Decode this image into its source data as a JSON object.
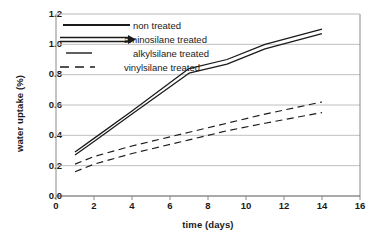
{
  "chart_data": {
    "type": "line",
    "title": "",
    "xlabel": "time (days)",
    "ylabel": "water uptake (%)",
    "xlim": [
      0,
      16
    ],
    "ylim": [
      0.0,
      1.2
    ],
    "xticks": [
      "0",
      "2",
      "4",
      "6",
      "8",
      "10",
      "12",
      "14",
      "16"
    ],
    "yticks": [
      "0.0",
      "0.2",
      "0.4",
      "0.6",
      "0.8",
      "1.0",
      "1.2"
    ],
    "grid": "horizontal",
    "legend_position": "top-left",
    "x": [
      1,
      2,
      4,
      7,
      9,
      11,
      14
    ],
    "series": [
      {
        "name": "non treated",
        "style": "solid",
        "values": [
          0.29,
          0.38,
          0.56,
          0.84,
          0.9,
          1.0,
          1.1
        ]
      },
      {
        "name": "aminosilane treated",
        "style": "solid",
        "values": [
          0.27,
          0.36,
          0.54,
          0.81,
          0.87,
          0.97,
          1.07
        ]
      },
      {
        "name": "alkylsilane treated",
        "style": "dashed",
        "values": [
          0.21,
          0.26,
          0.33,
          0.42,
          0.48,
          0.54,
          0.62
        ]
      },
      {
        "name": "vinylsilane treated",
        "style": "dashed",
        "values": [
          0.16,
          0.21,
          0.28,
          0.37,
          0.43,
          0.48,
          0.55
        ]
      }
    ]
  },
  "legend": {
    "items": [
      {
        "label": "non treated",
        "swatch": "solid-thick"
      },
      {
        "label": "aminosilane treated",
        "swatch": "double-line"
      },
      {
        "label": "alkylsilane treated",
        "swatch": "solid-short"
      },
      {
        "label": "vinylsilane treated",
        "swatch": "dashed"
      }
    ]
  },
  "colors": {
    "line": "#1a1a1a",
    "grid": "#b9b9b9",
    "axis": "#7a7a7a",
    "background": "#ffffff"
  }
}
